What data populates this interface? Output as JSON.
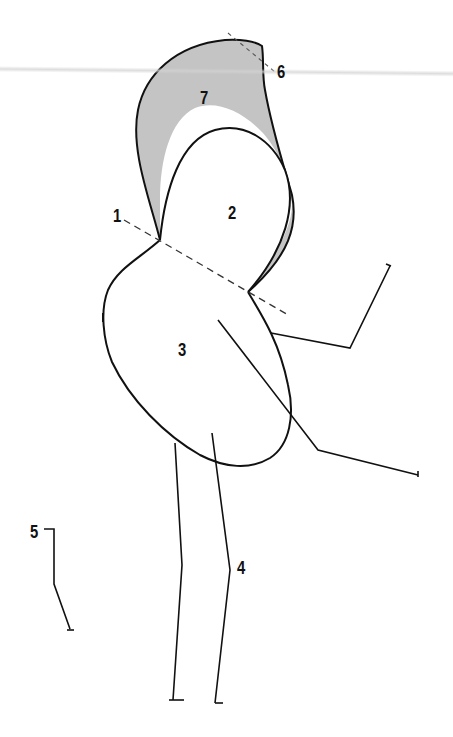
{
  "diagram": {
    "type": "line-drawing",
    "colors": {
      "stroke": "#111111",
      "fill_shaded": "#c4c4c4",
      "background": "#ffffff",
      "dashed": "#333333"
    },
    "labels": [
      {
        "id": "1",
        "text": "1",
        "x": 113,
        "y": 206
      },
      {
        "id": "2",
        "text": "2",
        "x": 228,
        "y": 203
      },
      {
        "id": "3",
        "text": "3",
        "x": 178,
        "y": 340
      },
      {
        "id": "4",
        "text": "4",
        "x": 237,
        "y": 558
      },
      {
        "id": "5",
        "text": "5",
        "x": 30,
        "y": 522
      },
      {
        "id": "6",
        "text": "6",
        "x": 277,
        "y": 62
      },
      {
        "id": "7",
        "text": "7",
        "x": 200,
        "y": 88
      }
    ]
  }
}
